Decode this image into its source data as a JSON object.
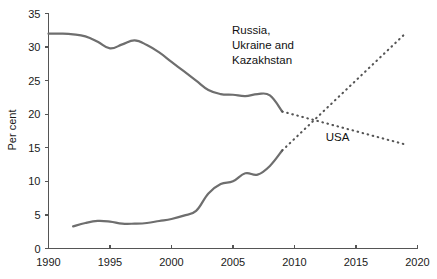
{
  "chart_data": {
    "type": "line",
    "title": "",
    "xlabel": "",
    "ylabel": "Per cent",
    "xlim": [
      1990,
      2020
    ],
    "ylim": [
      0,
      35
    ],
    "xticks": [
      1990,
      1995,
      2000,
      2005,
      2010,
      2015,
      2020
    ],
    "yticks": [
      0,
      5,
      10,
      15,
      20,
      25,
      30,
      35
    ],
    "xtick_labels": [
      "1990",
      "1995",
      "2000",
      "2005",
      "2010",
      "2015",
      "2020"
    ],
    "ytick_labels": [
      "0",
      "5",
      "10",
      "15",
      "20",
      "25",
      "30",
      "35"
    ],
    "grid": false,
    "legend": "annotations-inline",
    "annotations": [
      {
        "name": "russia-label",
        "text": "Russia, Ukraine and Kazakhstan",
        "lines": [
          "Russia,",
          "Ukraine and",
          "Kazakhstan"
        ],
        "x": 2022,
        "y": 33.2
      },
      {
        "name": "usa-label",
        "text": "USA",
        "lines": [
          "USA"
        ],
        "x": 2013.5,
        "y": 16.0
      }
    ],
    "series": [
      {
        "name": "Russia, Ukraine and Kazakhstan",
        "style": "solid",
        "color": "#6e6e6e",
        "x": [
          1990,
          1991,
          1992,
          1993,
          1994,
          1995,
          1996,
          1997,
          1998,
          1999,
          2000,
          2001,
          2002,
          2003,
          2004,
          2005,
          2006,
          2007,
          2008,
          2009
        ],
        "values": [
          32.0,
          32.0,
          31.9,
          31.6,
          30.8,
          29.8,
          30.4,
          31.0,
          30.3,
          29.2,
          27.8,
          26.4,
          25.0,
          23.6,
          23.0,
          22.9,
          22.7,
          23.0,
          22.8,
          20.4
        ]
      },
      {
        "name": "Russia, Ukraine and Kazakhstan (projection)",
        "style": "dotted",
        "color": "#555555",
        "x": [
          2009,
          2019
        ],
        "values": [
          20.4,
          15.5
        ]
      },
      {
        "name": "USA",
        "style": "solid",
        "color": "#6e6e6e",
        "x": [
          1992,
          1993,
          1994,
          1995,
          1996,
          1997,
          1998,
          1999,
          2000,
          2001,
          2002,
          2003,
          2004,
          2005,
          2006,
          2007,
          2008,
          2009
        ],
        "values": [
          3.3,
          3.8,
          4.1,
          4.0,
          3.7,
          3.7,
          3.8,
          4.1,
          4.4,
          4.9,
          5.6,
          8.2,
          9.6,
          10.0,
          11.2,
          11.0,
          12.3,
          14.6
        ]
      },
      {
        "name": "USA (projection)",
        "style": "dotted",
        "color": "#555555",
        "x": [
          2009,
          2019
        ],
        "values": [
          14.6,
          32.0
        ]
      }
    ]
  },
  "axis": {
    "y_title": "Per cent"
  }
}
